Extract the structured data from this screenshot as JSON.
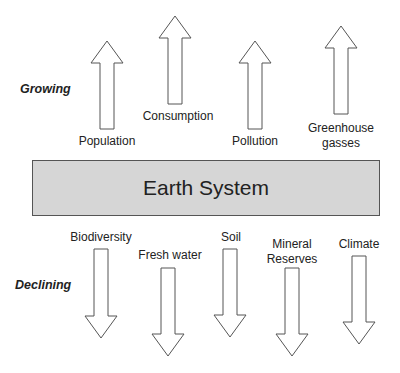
{
  "diagram": {
    "center": {
      "label": "Earth System",
      "fill": "#d6d6d6",
      "border": "#555555"
    },
    "growing": {
      "label": "Growing",
      "items": [
        {
          "label": "Population"
        },
        {
          "label": "Consumption"
        },
        {
          "label": "Pollution"
        },
        {
          "label": "Greenhouse",
          "label2": "gasses"
        }
      ]
    },
    "declining": {
      "label": "Declining",
      "items": [
        {
          "label": "Biodiversity"
        },
        {
          "label": "Fresh water"
        },
        {
          "label": "Soil"
        },
        {
          "label": "Mineral",
          "label2": "Reserves"
        },
        {
          "label": "Climate"
        }
      ]
    },
    "arrow_style": {
      "fill": "#ffffff",
      "stroke": "#555555"
    }
  }
}
